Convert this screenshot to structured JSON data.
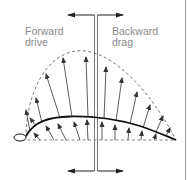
{
  "diagram": {
    "labels": {
      "forward": [
        "Forward",
        "drive"
      ],
      "backward": [
        "Backward",
        "drag"
      ]
    },
    "colors": {
      "stroke": "#1a1a1a",
      "arrow": "#444444",
      "dashed": "#777777",
      "text": "#8a8a8a"
    }
  }
}
